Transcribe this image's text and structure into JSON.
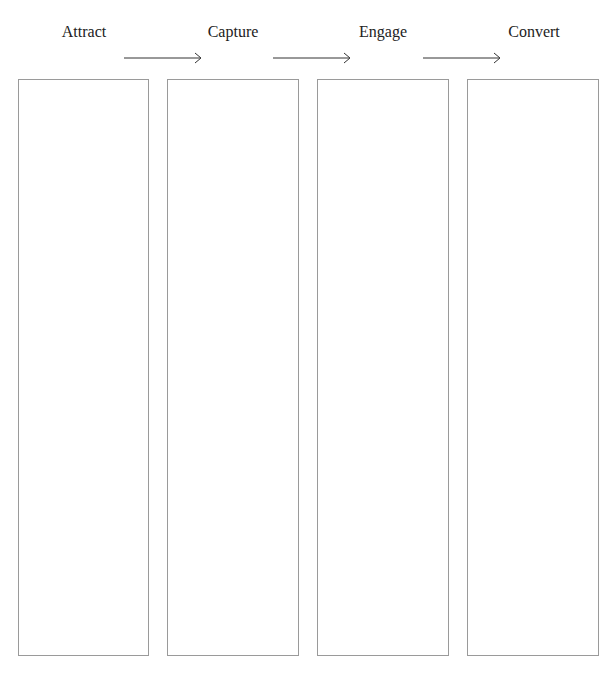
{
  "stages": [
    {
      "label": "Attract"
    },
    {
      "label": "Capture"
    },
    {
      "label": "Engage"
    },
    {
      "label": "Convert"
    }
  ],
  "arrows": 3,
  "colors": {
    "border": "#9a9a9a",
    "line": "#333333",
    "text": "#222222"
  }
}
